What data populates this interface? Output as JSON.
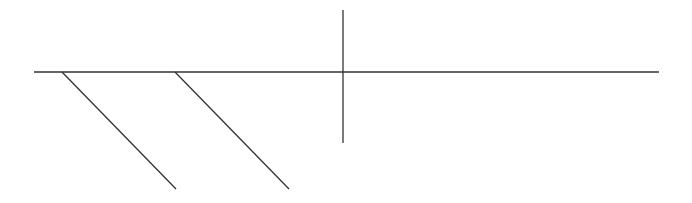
{
  "diagram": {
    "width": 692,
    "height": 203,
    "background": "#ffffff",
    "stroke_color": "#333333",
    "stroke_width": 1.3,
    "lines": [
      {
        "name": "main-horizontal-line",
        "x1": 34,
        "y1": 72,
        "x2": 659,
        "y2": 72
      },
      {
        "name": "vertical-cross-line",
        "x1": 343,
        "y1": 10,
        "x2": 343,
        "y2": 143
      },
      {
        "name": "diagonal-branch-1",
        "x1": 62,
        "y1": 72,
        "x2": 176,
        "y2": 189
      },
      {
        "name": "diagonal-branch-2",
        "x1": 175,
        "y1": 72,
        "x2": 289,
        "y2": 189
      }
    ]
  }
}
